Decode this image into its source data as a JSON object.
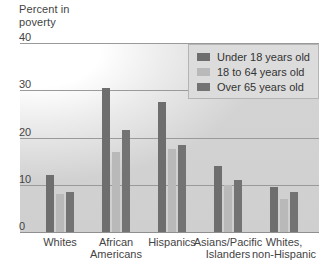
{
  "chart_data": {
    "type": "bar",
    "title": "Percent in\npoverty",
    "xlabel": "",
    "ylabel": "Percent in poverty",
    "ylim": [
      0,
      40
    ],
    "yticks": [
      0,
      10,
      20,
      30,
      40
    ],
    "ytick_labels": [
      "0",
      "10",
      "20",
      "30",
      "40"
    ],
    "grid": true,
    "legend_position": "top-right",
    "categories": [
      "Whites",
      "African\nAmericans",
      "Hispanics",
      "Asians/Pacific\nIslanders",
      "Whites,\nnon-Hispanic"
    ],
    "series": [
      {
        "name": "Under 18 years old",
        "color": "#6e6e6e",
        "values": [
          12.0,
          30.5,
          27.5,
          14.0,
          9.5
        ]
      },
      {
        "name": "18 to 64 years old",
        "color": "#b9b9b9",
        "values": [
          8.0,
          17.0,
          17.5,
          10.0,
          7.0
        ]
      },
      {
        "name": "Over 65 years old",
        "color": "#737373",
        "values": [
          8.5,
          21.5,
          18.5,
          11.0,
          8.5
        ]
      }
    ]
  }
}
